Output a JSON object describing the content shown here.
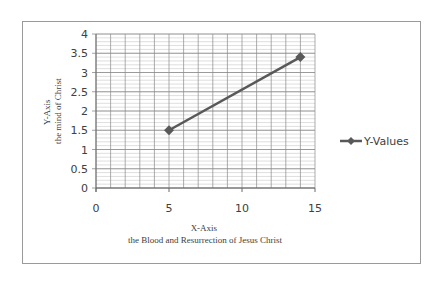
{
  "chart_data": {
    "type": "scatter",
    "title": "",
    "xlabel": "X-Axis\nthe Blood and Resurrection of Jesus Christ",
    "xlabel_lines": [
      "X-Axis",
      "the Blood and Resurrection of Jesus Christ"
    ],
    "ylabel": "Y-Axis\nthe mind of Christ",
    "ylabel_lines": [
      "Y-Axis",
      "the mind of Christ"
    ],
    "xlim": [
      0,
      15
    ],
    "ylim": [
      0,
      4
    ],
    "x_ticks": [
      0,
      5,
      10,
      15
    ],
    "y_ticks": [
      0,
      0.5,
      1,
      1.5,
      2,
      2.5,
      3,
      3.5,
      4
    ],
    "grid": true,
    "legend_position": "right",
    "series": [
      {
        "name": "Y-Values",
        "x": [
          5,
          14
        ],
        "y": [
          1.5,
          3.4
        ],
        "color": "#595959",
        "marker": "diamond",
        "line": true
      }
    ]
  },
  "legend": {
    "label": "Y-Values"
  }
}
